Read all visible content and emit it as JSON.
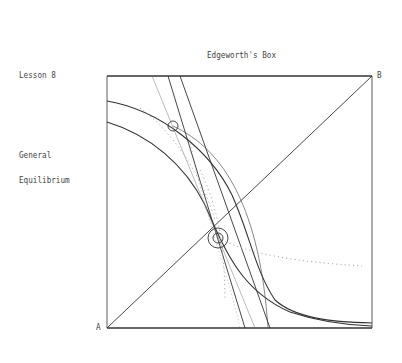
{
  "title": "Edgeworth's Box",
  "sidebar": {
    "lesson": "Lesson 8",
    "topic_line1": "General",
    "topic_line2": "Equilibrium"
  },
  "corners": {
    "origin_a": "A",
    "origin_b": "B"
  },
  "diagram": {
    "box": {
      "x0": 107,
      "y0": 76,
      "x1": 372,
      "y1": 328
    },
    "contract_curve": "diagonal from A to B",
    "equilibrium_marker": {
      "x": 218,
      "y": 238,
      "type": "double-circle"
    },
    "initial_marker": {
      "x": 173,
      "y": 126,
      "type": "circle"
    },
    "line_color": "#333333",
    "dotted_color": "#aaaaaa"
  }
}
